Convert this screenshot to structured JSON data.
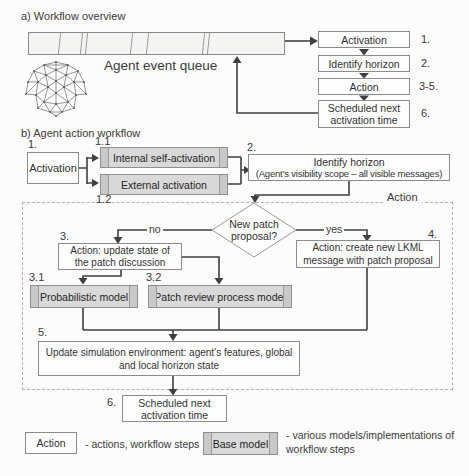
{
  "colors": {
    "box_fill": "#fdfdfd",
    "model_fill": "#d9d9d9",
    "border": "#8c8c8c",
    "line": "#3f3f3f"
  },
  "section_a": {
    "title": "a) Workflow overview",
    "queue_label": "Agent event queue",
    "steps": [
      {
        "number": "1.",
        "label": "Activation"
      },
      {
        "number": "2.",
        "label": "Identify horizon"
      },
      {
        "number": "3-5.",
        "label": "Action"
      },
      {
        "number": "6.",
        "label": "Scheduled next activation time"
      }
    ]
  },
  "section_b": {
    "title": "b) Agent action workflow",
    "action_region_label": "Action",
    "activation": {
      "number": "1.",
      "label": "Activation"
    },
    "internal_activation": {
      "number": "1.1",
      "label": "Internal self-activation"
    },
    "external_activation": {
      "number": "1.2",
      "label": "External activation"
    },
    "identify_horizon": {
      "number": "2.",
      "line1": "Identify horizon",
      "line2": "(Agent’s visibility scope – all visible messages)"
    },
    "decision": {
      "question": "New patch proposal?",
      "no_label": "no",
      "yes_label": "yes"
    },
    "update_state": {
      "number": "3.",
      "label": "Action: update state of the patch discussion"
    },
    "create_message": {
      "number": "4.",
      "label": "Action: create new LKML message with patch proposal"
    },
    "probabilistic_model": {
      "number": "3.1",
      "label": "Probabilistic model"
    },
    "patch_review_model": {
      "number": "3.2",
      "label": "Patch review process model"
    },
    "update_environment": {
      "number": "5.",
      "label": "Update simulation environment: agent’s features, global and local horizon state"
    },
    "scheduled_next": {
      "number": "6.",
      "label": "Scheduled next activation time"
    }
  },
  "legend": {
    "action": {
      "box_label": "Action",
      "description": "- actions, workflow steps"
    },
    "base_model": {
      "box_label": "Base model",
      "description": "- various models/implementations of workflow steps"
    }
  }
}
